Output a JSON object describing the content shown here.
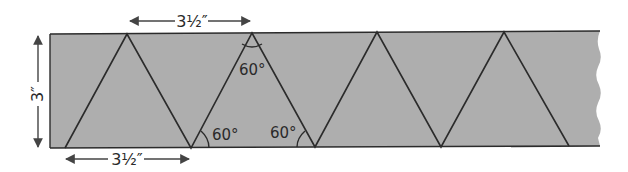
{
  "diagram": {
    "colors": {
      "strip_fill": "#aeaeae",
      "line": "#2b2b2b",
      "background": "#ffffff"
    },
    "dimensions": {
      "top_width_label": "3½″",
      "bottom_width_label": "3½″",
      "height_label": "3″"
    },
    "angle_labels": {
      "apex": "60°",
      "base_left": "60°",
      "base_right": "60°"
    },
    "triangle_count_upright": 4,
    "right_edge": "torn / wavy"
  }
}
